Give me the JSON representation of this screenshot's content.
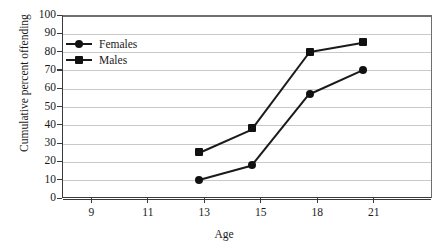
{
  "chart_data": {
    "type": "line",
    "title": "",
    "xlabel": "Age",
    "ylabel": "Cumulative percent offending",
    "x_tick_labels": [
      "9",
      "11",
      "13",
      "15",
      "18",
      "21"
    ],
    "y_tick_labels": [
      "0",
      "10",
      "20",
      "30",
      "40",
      "50",
      "60",
      "70",
      "80",
      "90",
      "100"
    ],
    "ylim": [
      0,
      100
    ],
    "grid": "horizontal",
    "legend_position": "top-left-inside",
    "x": [
      12.8,
      14.7,
      17.6,
      20.4
    ],
    "series": [
      {
        "name": "Females",
        "marker": "circle",
        "values": [
          10,
          18,
          57,
          70
        ]
      },
      {
        "name": "Males",
        "marker": "square",
        "values": [
          25,
          38,
          80,
          85
        ]
      }
    ],
    "colors": {
      "line": "#1a1a1a",
      "marker": "#111111",
      "gridline": "#c9c9c9",
      "axis": "#3a3a3a",
      "background": "#ffffff"
    }
  },
  "legend": {
    "items": [
      {
        "label": "Females",
        "marker": "circle"
      },
      {
        "label": "Males",
        "marker": "square"
      }
    ]
  }
}
